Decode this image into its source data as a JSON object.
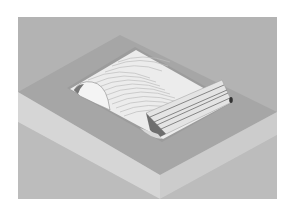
{
  "image": {
    "subject": "isometric CAD render of machined block with contoured pocket",
    "colors": {
      "page_background": "#ffffff",
      "backdrop": "#b3b3b3",
      "top_face": "#a9a9a9",
      "front_left_face": "#d4d4d4",
      "front_right_face": "#cfcfcf",
      "lower_background": "#bdbdbd",
      "pocket_floor": "#eeeeee",
      "pocket_wall": "#9a9a9a",
      "contour_line": "#bfbfbf",
      "rib_face": "#e6e6e6",
      "rib_groove": "#7a7a7a",
      "edge_dark": "#555555"
    }
  }
}
